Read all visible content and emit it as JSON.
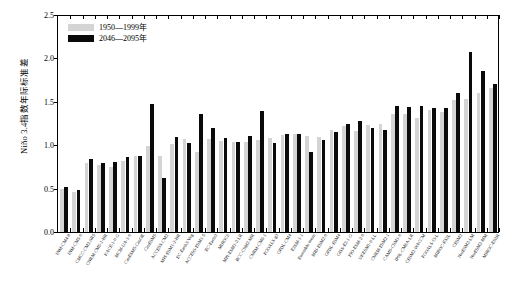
{
  "chart_data": {
    "type": "bar",
    "title": "",
    "subtitle": "",
    "xlabel": "",
    "ylabel": "Niño 3.4指数年际标准差",
    "ylim": [
      0.0,
      2.5
    ],
    "ytick_labels": [
      "0.0",
      "0.5",
      "1.0",
      "1.5",
      "2.0",
      "2.5"
    ],
    "ytick_values": [
      0.0,
      0.5,
      1.0,
      1.5,
      2.0,
      2.5
    ],
    "grid": false,
    "legend_position": "top-left",
    "legend": [
      "1950—1999年",
      "2046—2095年"
    ],
    "categories": [
      "INM-CM4-8",
      "INM-CM5-0",
      "CMCC-CM2-SR5",
      "CNRM-CM6-1-HR",
      "KACE-1-0-G",
      "MCM-UA-1-0",
      "CanESM5-CanOE",
      "CanESM5",
      "ACCESS-CM2",
      "MPI-ESM1-2-HR",
      "EC-Earth3-Veg",
      "ACCESS-ESM1-5",
      "EC-Earth3",
      "MIROC6",
      "MPI-ESM1-2-LR",
      "BCC-CSM2-MR",
      "CNRM-CM6-1",
      "FGOALS-g3",
      "GFDL-CM4",
      "E3SM-1-1",
      "Ensemble mean",
      "MRI-ESM2-0",
      "GFDL-ESM4",
      "GISS-E2-1-G",
      "FIO-ESM-2-0",
      "UKESM1-0-LL",
      "CNRM-ESM2-1",
      "CAMS-CSM1-0",
      "IPSL-CM6A-LR",
      "CESM2-WACCM",
      "FGOALS-f3-L",
      "MIROC-ES2L",
      "CESM2",
      "NorESM2-LM",
      "NorESM2-MM",
      "MIROC-ES2H"
    ],
    "series": [
      {
        "name": "1950—1999年",
        "color": "#d4d4d4",
        "values": [
          0.5,
          0.46,
          0.8,
          0.77,
          0.75,
          0.82,
          0.87,
          0.99,
          0.88,
          1.01,
          1.07,
          0.92,
          1.07,
          1.05,
          1.04,
          1.04,
          1.06,
          1.08,
          1.12,
          1.13,
          1.11,
          1.09,
          1.18,
          1.22,
          1.16,
          1.23,
          1.24,
          1.36,
          1.36,
          1.31,
          1.4,
          1.38,
          1.52,
          1.53,
          1.6,
          1.66
        ]
      },
      {
        "name": "2046—2095年",
        "color": "#0a0a0a",
        "values": [
          0.52,
          0.48,
          0.84,
          0.8,
          0.81,
          0.86,
          0.88,
          1.47,
          0.62,
          1.09,
          1.02,
          1.36,
          1.2,
          1.08,
          1.04,
          1.11,
          1.39,
          1.02,
          1.13,
          1.13,
          0.92,
          1.06,
          1.15,
          1.25,
          1.28,
          1.2,
          1.18,
          1.45,
          1.44,
          1.45,
          1.43,
          1.43,
          1.6,
          2.07,
          1.86,
          1.7
        ]
      }
    ]
  }
}
